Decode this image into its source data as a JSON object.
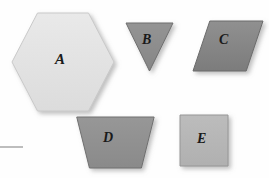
{
  "figure": {
    "background_color": "#fefefe",
    "label_color": "#1a1a1a",
    "shadow_color": "rgba(120,120,120,0.55)"
  },
  "margin_rule": {
    "name": "margin-rule",
    "x": 0,
    "y": 146,
    "width": 23,
    "height": 2,
    "color": "#bdbdbd"
  },
  "shapes": [
    {
      "id": "A",
      "label": "A",
      "type": "hexagon",
      "x": 12,
      "y": 13,
      "width": 102,
      "height": 98,
      "fill": "#e9e9e9",
      "fill_dark": "#dcdcdc",
      "stroke": "#c9c9c9",
      "label_x": 55,
      "label_y": 52,
      "label_size": 15
    },
    {
      "id": "B",
      "label": "B",
      "type": "triangle-down",
      "x": 126,
      "y": 23,
      "width": 47,
      "height": 48,
      "fill": "#949494",
      "fill_dark": "#868686",
      "stroke": "#6f6f6f",
      "label_x": 142,
      "label_y": 33,
      "label_size": 14
    },
    {
      "id": "C",
      "label": "C",
      "type": "parallelogram",
      "x": 193,
      "y": 21,
      "width": 70,
      "height": 50,
      "fill": "#909090",
      "fill_dark": "#7c7c7c",
      "stroke": "#6b6b6b",
      "label_x": 219,
      "label_y": 33,
      "label_size": 14
    },
    {
      "id": "D",
      "label": "D",
      "type": "trapezoid",
      "x": 63,
      "y": 117,
      "width": 98,
      "height": 51,
      "fill": "#979797",
      "fill_dark": "#8a8a8a",
      "stroke": "#707070",
      "label_x": 103,
      "label_y": 131,
      "label_size": 14
    },
    {
      "id": "E",
      "label": "E",
      "type": "square",
      "x": 180,
      "y": 115,
      "width": 48,
      "height": 51,
      "fill": "#bcbcbc",
      "fill_dark": "#b0b0b0",
      "stroke": "#969696",
      "label_x": 197,
      "label_y": 132,
      "label_size": 14
    }
  ]
}
